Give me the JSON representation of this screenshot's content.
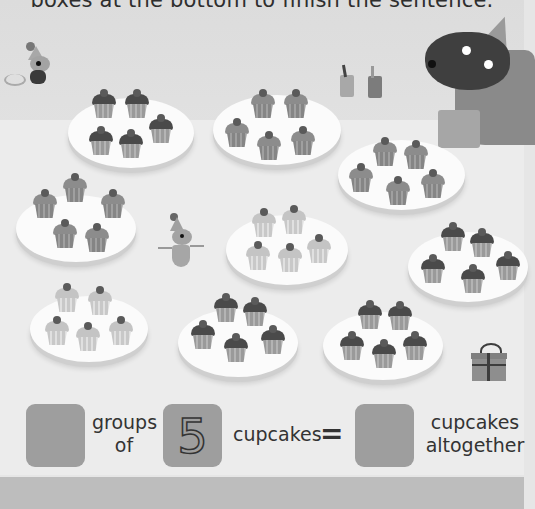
{
  "instruction": "boxes at the bottom to finish the sentence.",
  "scene": {
    "characters": [
      "mouse-with-scarf",
      "bear-with-party-hat-and-gift",
      "dancing-mouse-with-party-hat"
    ],
    "props": [
      "juice-boxes",
      "gift-box"
    ],
    "plates": [
      {
        "id": 1,
        "cupcakes": 5,
        "tone": "dark"
      },
      {
        "id": 2,
        "cupcakes": 5,
        "tone": "mid"
      },
      {
        "id": 3,
        "cupcakes": 5,
        "tone": "mid"
      },
      {
        "id": 4,
        "cupcakes": 5,
        "tone": "mid"
      },
      {
        "id": 5,
        "cupcakes": 5,
        "tone": "light"
      },
      {
        "id": 6,
        "cupcakes": 5,
        "tone": "dark"
      },
      {
        "id": 7,
        "cupcakes": 5,
        "tone": "light"
      },
      {
        "id": 8,
        "cupcakes": 5,
        "tone": "dark"
      },
      {
        "id": 9,
        "cupcakes": 5,
        "tone": "dark"
      }
    ]
  },
  "sentence": {
    "box1_value": "",
    "label_groups": "groups",
    "label_of": "of",
    "box2_value": "5",
    "label_cupcakes": "cupcakes",
    "equals": "=",
    "box3_value": "",
    "label_result_line1": "cupcakes",
    "label_result_line2": "altogether"
  },
  "colors": {
    "background": "#e6e6e6",
    "answer_box": "#9e9e9e",
    "footer_band": "#bdbdbd"
  }
}
